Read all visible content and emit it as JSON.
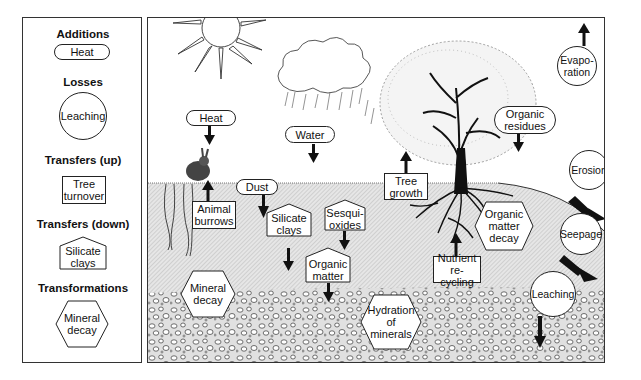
{
  "legend": {
    "additions": {
      "title": "Additions",
      "example": "Heat",
      "shape": "pill"
    },
    "losses": {
      "title": "Losses",
      "example": "Leaching",
      "shape": "circle"
    },
    "transfers_up": {
      "title": "Transfers (up)",
      "example_line1": "Tree",
      "example_line2": "turnover",
      "shape": "rectangle"
    },
    "transfers_down": {
      "title": "Transfers (down)",
      "example_line1": "Silicate",
      "example_line2": "clays",
      "shape": "pentagon"
    },
    "transformations": {
      "title": "Transformations",
      "example_line1": "Mineral",
      "example_line2": "decay",
      "shape": "hexagon"
    }
  },
  "diagram": {
    "additions": [
      {
        "label": "Heat",
        "arrow": "down",
        "icon": "sun-icon"
      },
      {
        "label": "Water",
        "arrow": "down",
        "icon": "rain-cloud-icon"
      },
      {
        "label": "Dust",
        "arrow": "down"
      },
      {
        "line1": "Organic",
        "line2": "residues",
        "arrow": "down"
      }
    ],
    "losses": [
      {
        "line1": "Evapo-",
        "line2": "ration",
        "arrow": "up"
      },
      {
        "label": "Erosion",
        "arrow": "down-right"
      },
      {
        "label": "Seepage",
        "arrow": "down-right"
      },
      {
        "label": "Leaching",
        "arrow": "down"
      }
    ],
    "transfers_up": [
      {
        "line1": "Animal",
        "line2": "burrows",
        "icon": "rabbit-icon"
      },
      {
        "line1": "Tree",
        "line2": "growth"
      },
      {
        "line1": "Nutrient",
        "line2": "re-cycling"
      }
    ],
    "transfers_down": [
      {
        "line1": "Silicate",
        "line2": "clays"
      },
      {
        "line1": "Sesqui-",
        "line2": "oxides"
      },
      {
        "line1": "Organic",
        "line2": "matter"
      }
    ],
    "transformations": [
      {
        "line1": "Mineral",
        "line2": "decay"
      },
      {
        "line1": "Organic",
        "line2": "matter",
        "line3": "decay"
      },
      {
        "line1": "Hydration",
        "line2": "of",
        "line3": "minerals"
      }
    ]
  },
  "colors": {
    "line": "#222222",
    "topsoil": "#d8d8d8",
    "subsoil": "#e4e4e4",
    "background": "#ffffff"
  }
}
